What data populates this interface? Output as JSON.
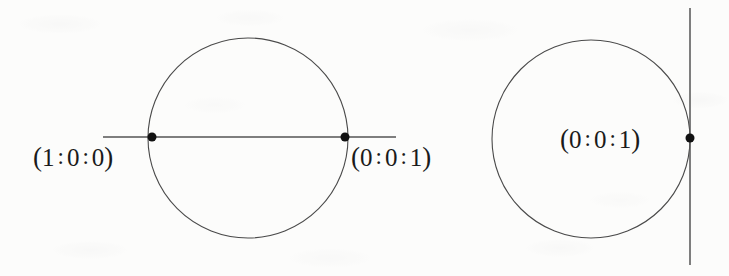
{
  "figure": {
    "background_color": "#fcfcfb",
    "stroke_color": "#3a3a3a",
    "text_color": "#1a1a1a",
    "width": 729,
    "height": 276
  },
  "left_diagram": {
    "name": "circle-with-secant-line",
    "circle": {
      "cx": 248,
      "cy": 138,
      "r": 100
    },
    "line": {
      "x1": 103,
      "y1": 137,
      "x2": 396,
      "y2": 137,
      "orientation": "horizontal"
    },
    "points": [
      {
        "id": "left-point",
        "cx": 152,
        "cy": 137,
        "r": 4.5,
        "label": "(1 : 0 : 0)",
        "label_parts": {
          "open": "(",
          "a": "1",
          "b": "0",
          "c": "0",
          "close": ")",
          "sep": ":"
        },
        "label_x": 33,
        "label_y": 144,
        "label_anchor": "left-of-point"
      },
      {
        "id": "right-point",
        "cx": 345,
        "cy": 137,
        "r": 4.5,
        "label": "(0 : 0 : 1)",
        "label_parts": {
          "open": "(",
          "a": "0",
          "b": "0",
          "c": "1",
          "close": ")",
          "sep": ":"
        },
        "label_x": 351,
        "label_y": 144,
        "label_anchor": "right-of-point"
      }
    ]
  },
  "right_diagram": {
    "name": "circle-with-tangent-line",
    "circle": {
      "cx": 591,
      "cy": 139,
      "r": 99
    },
    "line": {
      "x1": 690,
      "y1": 8,
      "x2": 690,
      "y2": 265,
      "orientation": "vertical"
    },
    "points": [
      {
        "id": "tangency-point",
        "cx": 690,
        "cy": 138,
        "r": 4.5,
        "label": "(0 : 0 : 1)",
        "label_parts": {
          "open": "(",
          "a": "0",
          "b": "0",
          "c": "1",
          "close": ")",
          "sep": ":"
        },
        "label_x": 560,
        "label_y": 126,
        "label_anchor": "left-of-point"
      }
    ]
  }
}
